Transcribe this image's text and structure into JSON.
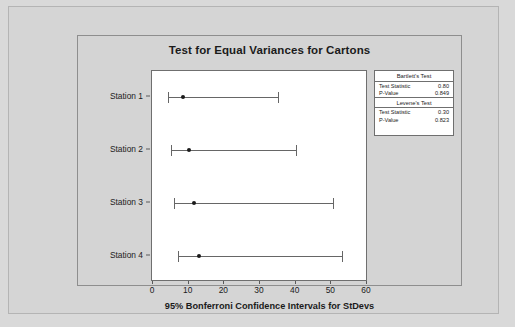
{
  "chart_data": {
    "type": "errorbar",
    "title": "Test for Equal Variances for Cartons",
    "xlabel": "95% Bonferroni Confidence Intervals for StDevs",
    "ylabel": "",
    "xlim": [
      0,
      60
    ],
    "xticks": [
      "0",
      "10",
      "20",
      "30",
      "40",
      "50",
      "60"
    ],
    "xtick_values": [
      0,
      10,
      20,
      30,
      40,
      50,
      60
    ],
    "grid": false,
    "categories": [
      "Station 1",
      "Station 2",
      "Station 3",
      "Station 4"
    ],
    "series": [
      {
        "name": "Bonferroni CI for StDev",
        "points": [
          {
            "category": "Station 1",
            "estimate": 8.4,
            "lower": 4.2,
            "upper": 35.0
          },
          {
            "category": "Station 2",
            "estimate": 10.0,
            "lower": 5.0,
            "upper": 40.0
          },
          {
            "category": "Station 3",
            "estimate": 11.5,
            "lower": 6.0,
            "upper": 50.5
          },
          {
            "category": "Station 4",
            "estimate": 13.0,
            "lower": 7.0,
            "upper": 53.0
          }
        ]
      }
    ],
    "annotations": {
      "bartlett": {
        "title": "Bartlett's Test",
        "test_statistic": "0.80",
        "p_value": "0.849"
      },
      "levene": {
        "title": "Levene's Test",
        "test_statistic": "0.30",
        "p_value": "0.823"
      }
    }
  },
  "stats_panel": {
    "bartlett_title": "Bartlett's Test",
    "levene_title": "Levene's Test",
    "test_statistic_label": "Test Statistic",
    "p_value_label": "P-Value",
    "bartlett_test_statistic": "0.80",
    "bartlett_p_value": "0.849",
    "levene_test_statistic": "0.30",
    "levene_p_value": "0.823"
  },
  "colors": {
    "page_background": "#d9d9d9",
    "plot_background": "#ffffff",
    "line": "#666666",
    "marker": "#1a1a1a",
    "text": "#1b1b1b"
  }
}
